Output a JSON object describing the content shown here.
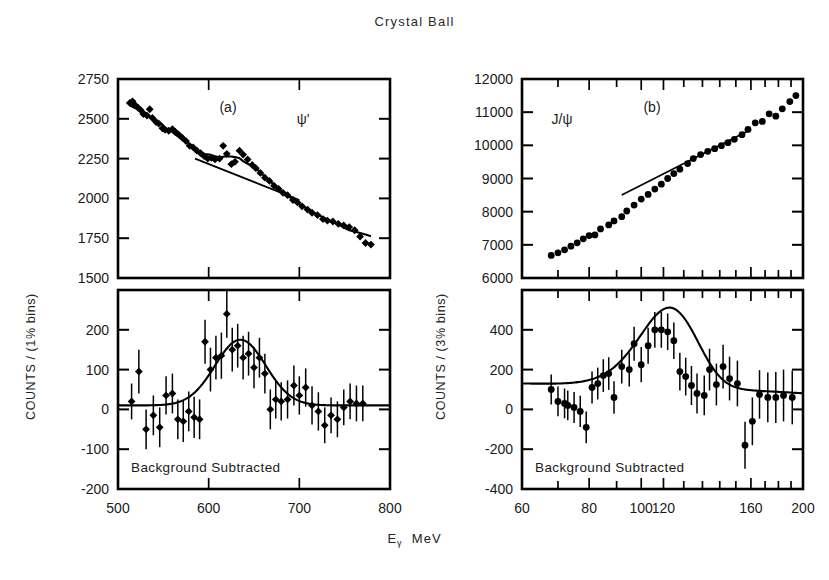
{
  "figure": {
    "title": "Crystal Ball",
    "xaxis_label_main": "E",
    "xaxis_label_sub": "γ",
    "xaxis_label_unit": "MeV",
    "ylabel_left": "COUNTS / (1% bins)",
    "ylabel_right": "COUNTS / (3% bins)",
    "background_note": "Background Subtracted"
  },
  "chart_data": [
    {
      "id": "panel-a-top",
      "type": "scatter",
      "title": "",
      "panel_tag": "(a)",
      "resonance_label": "ψ'",
      "xlabel": "Eγ MeV",
      "ylabel": "COUNTS / (1% bins)",
      "xscale": "linear",
      "yscale": "linear",
      "xlim": [
        500,
        800
      ],
      "ylim": [
        1500,
        2750
      ],
      "xticks": [
        500,
        600,
        700,
        800
      ],
      "xticklabels": [
        "500",
        "600",
        "700",
        "800"
      ],
      "yticks": [
        1500,
        1750,
        2000,
        2250,
        2500,
        2750
      ],
      "yticklabels": [
        "1500",
        "1750",
        "2000",
        "2250",
        "2500",
        "2750"
      ],
      "grid": false,
      "legend": "none",
      "series": [
        {
          "name": "inclusive photon spectrum",
          "marker": "filled-diamond",
          "x": [
            513,
            516,
            519,
            522,
            525,
            528,
            532,
            535,
            538,
            542,
            545,
            549,
            552,
            556,
            560,
            563,
            567,
            571,
            575,
            579,
            583,
            587,
            591,
            595,
            599,
            603,
            607,
            612,
            616,
            620,
            625,
            629,
            634,
            638,
            643,
            648,
            652,
            657,
            662,
            667,
            672,
            677,
            682,
            687,
            693,
            698,
            703,
            709,
            714,
            720,
            726,
            731,
            737,
            743,
            749,
            755,
            761,
            767,
            773,
            779
          ],
          "y": [
            2600,
            2610,
            2585,
            2570,
            2555,
            2530,
            2520,
            2560,
            2505,
            2480,
            2470,
            2440,
            2430,
            2425,
            2435,
            2420,
            2400,
            2380,
            2360,
            2330,
            2320,
            2300,
            2285,
            2265,
            2250,
            2255,
            2245,
            2250,
            2330,
            2280,
            2215,
            2230,
            2300,
            2275,
            2245,
            2210,
            2190,
            2160,
            2130,
            2110,
            2080,
            2060,
            2035,
            2020,
            1990,
            1975,
            1950,
            1930,
            1910,
            1895,
            1870,
            1860,
            1855,
            1840,
            1830,
            1820,
            1800,
            1760,
            1720,
            1710
          ]
        }
      ],
      "fit_curve": {
        "name": "signal + background fit",
        "description": "smooth fit through data"
      },
      "background_line": {
        "name": "background polynomial",
        "description": "straight line under the psi-prime peak",
        "x": [
          585,
          700
        ],
        "y": [
          2250,
          1990
        ]
      }
    },
    {
      "id": "panel-a-bottom",
      "type": "scatter",
      "title": "",
      "annotation": "Background Subtracted",
      "xlabel": "Eγ MeV",
      "ylabel": "COUNTS / (1% bins)",
      "xscale": "linear",
      "yscale": "linear",
      "xlim": [
        500,
        800
      ],
      "ylim": [
        -200,
        300
      ],
      "xticks": [
        500,
        600,
        700,
        800
      ],
      "xticklabels": [
        "500",
        "600",
        "700",
        "800"
      ],
      "yticks": [
        -200,
        -100,
        0,
        100,
        200
      ],
      "yticklabels": [
        "-200",
        "-100",
        "0",
        "100",
        "200"
      ],
      "grid": false,
      "legend": "none",
      "series": [
        {
          "name": "background subtracted counts",
          "marker": "filled-diamond",
          "x": [
            515,
            523,
            531,
            539,
            546,
            553,
            560,
            566,
            572,
            578,
            584,
            590,
            596,
            602,
            608,
            614,
            620,
            626,
            632,
            638,
            644,
            650,
            656,
            662,
            668,
            674,
            680,
            687,
            694,
            700,
            707,
            714,
            721,
            728,
            735,
            742,
            749,
            756,
            763,
            770
          ],
          "y": [
            20,
            95,
            -50,
            -15,
            -45,
            35,
            40,
            -25,
            -30,
            -5,
            -20,
            -25,
            170,
            100,
            130,
            135,
            240,
            150,
            160,
            130,
            140,
            105,
            130,
            90,
            0,
            25,
            20,
            25,
            60,
            35,
            55,
            10,
            -5,
            -40,
            -15,
            -25,
            5,
            20,
            15,
            15
          ],
          "yerr": [
            45,
            55,
            50,
            50,
            50,
            48,
            50,
            50,
            52,
            50,
            52,
            50,
            55,
            55,
            55,
            58,
            60,
            55,
            55,
            55,
            55,
            52,
            50,
            50,
            50,
            48,
            48,
            48,
            50,
            48,
            48,
            48,
            48,
            45,
            45,
            45,
            45,
            45,
            45,
            45
          ]
        }
      ],
      "fit_curve": {
        "name": "gaussian peak fit",
        "peak_center": 635,
        "peak_height": 165,
        "peak_width_sigma": 28
      }
    },
    {
      "id": "panel-b-top",
      "type": "scatter",
      "panel_tag": "(b)",
      "resonance_label": "J/ψ",
      "xlabel": "Eγ MeV",
      "ylabel": "COUNTS / (3% bins)",
      "xscale": "log",
      "yscale": "linear",
      "xlim": [
        60,
        200
      ],
      "ylim": [
        6000,
        12000
      ],
      "xticks": [
        60,
        70,
        80,
        90,
        100,
        110,
        120,
        130,
        140,
        150,
        160,
        170,
        180,
        190,
        200
      ],
      "xticklabels": [
        "60",
        "",
        "80",
        "",
        "100",
        "120",
        "",
        "",
        "",
        "",
        "160",
        "",
        "",
        "",
        "200"
      ],
      "yticks": [
        6000,
        7000,
        8000,
        9000,
        10000,
        11000,
        12000
      ],
      "yticklabels": [
        "6000",
        "7000",
        "8000",
        "9000",
        "10000",
        "11000",
        "12000"
      ],
      "grid": false,
      "legend": "none",
      "series": [
        {
          "name": "inclusive photon spectrum",
          "marker": "filled-circle",
          "x": [
            68,
            70,
            72,
            74,
            76,
            78,
            80,
            82,
            84,
            87,
            89,
            92,
            94,
            97,
            100,
            103,
            106,
            109,
            112,
            115,
            118,
            122,
            125,
            129,
            133,
            137,
            141,
            145,
            149,
            154,
            158,
            163,
            168,
            173,
            178,
            183,
            189,
            194
          ],
          "y": [
            6680,
            6760,
            6850,
            6960,
            7060,
            7180,
            7280,
            7300,
            7480,
            7600,
            7720,
            7850,
            8020,
            8200,
            8380,
            8520,
            8680,
            8830,
            9000,
            9150,
            9280,
            9450,
            9600,
            9720,
            9820,
            9900,
            9990,
            10080,
            10180,
            10320,
            10480,
            10680,
            10720,
            10950,
            10880,
            11100,
            11320,
            11500
          ],
          "yerr": [
            60,
            60,
            60,
            60,
            60,
            60,
            60,
            60,
            60,
            62,
            62,
            62,
            62,
            62,
            65,
            65,
            65,
            65,
            65,
            68,
            68,
            68,
            68,
            70,
            70,
            70,
            70,
            72,
            72,
            75,
            75,
            78,
            78,
            80,
            80,
            82,
            85,
            88
          ]
        }
      ],
      "background_line": {
        "name": "background polynomial",
        "description": "straight line under the J/psi peak",
        "x": [
          92,
          160
        ],
        "y": [
          8500,
          10480
        ]
      }
    },
    {
      "id": "panel-b-bottom",
      "type": "scatter",
      "annotation": "Background Subtracted",
      "xlabel": "Eγ MeV",
      "ylabel": "COUNTS / (3% bins)",
      "xscale": "log",
      "yscale": "linear",
      "xlim": [
        60,
        200
      ],
      "ylim": [
        -400,
        600
      ],
      "xticks": [
        60,
        70,
        80,
        90,
        100,
        110,
        120,
        130,
        140,
        150,
        160,
        170,
        180,
        190,
        200
      ],
      "xticklabels": [
        "60",
        "",
        "80",
        "",
        "100",
        "120",
        "",
        "",
        "",
        "",
        "160",
        "",
        "",
        "",
        "200"
      ],
      "yticks": [
        -400,
        -200,
        0,
        200,
        400
      ],
      "yticklabels": [
        "-400",
        "-200",
        "0",
        "200",
        "400"
      ],
      "grid": false,
      "legend": "none",
      "series": [
        {
          "name": "background subtracted counts",
          "marker": "filled-circle",
          "x": [
            68,
            70,
            72,
            73,
            75,
            77,
            79,
            81,
            83,
            85,
            87,
            89,
            92,
            95,
            97,
            100,
            103,
            106,
            109,
            112,
            115,
            118,
            121,
            124,
            127,
            131,
            134,
            138,
            142,
            146,
            151,
            156,
            161,
            166,
            172,
            178,
            184,
            191
          ],
          "y": [
            100,
            40,
            30,
            20,
            10,
            -10,
            -90,
            110,
            130,
            170,
            180,
            60,
            215,
            200,
            330,
            225,
            320,
            400,
            400,
            390,
            345,
            190,
            165,
            120,
            80,
            70,
            200,
            125,
            215,
            155,
            130,
            -180,
            -60,
            75,
            60,
            60,
            70,
            60
          ],
          "yerr": [
            75,
            75,
            75,
            75,
            78,
            78,
            80,
            80,
            80,
            82,
            82,
            82,
            85,
            85,
            85,
            88,
            90,
            90,
            90,
            92,
            92,
            95,
            95,
            98,
            100,
            100,
            105,
            105,
            110,
            110,
            115,
            118,
            120,
            122,
            125,
            128,
            130,
            135
          ]
        }
      ],
      "fit_curve": {
        "name": "gaussian peak fit",
        "peak_center": 113,
        "peak_height": 400,
        "peak_width_sigma": 14
      }
    }
  ]
}
